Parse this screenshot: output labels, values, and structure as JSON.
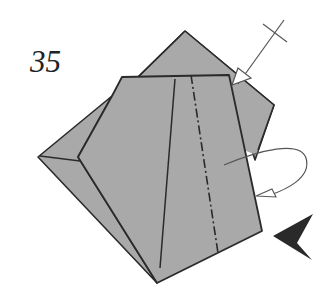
{
  "diagram": {
    "step_number": "35",
    "paper_color": "#a9a9a9",
    "line_color": "#2a2a2a",
    "arrow_color": "#333333",
    "symbols": [
      {
        "name": "valley-fold-dash-dot-line"
      },
      {
        "name": "push-arrow-with-crossbar"
      },
      {
        "name": "turn-over-loop-arrow"
      },
      {
        "name": "viewing-direction-arrowhead"
      }
    ]
  }
}
